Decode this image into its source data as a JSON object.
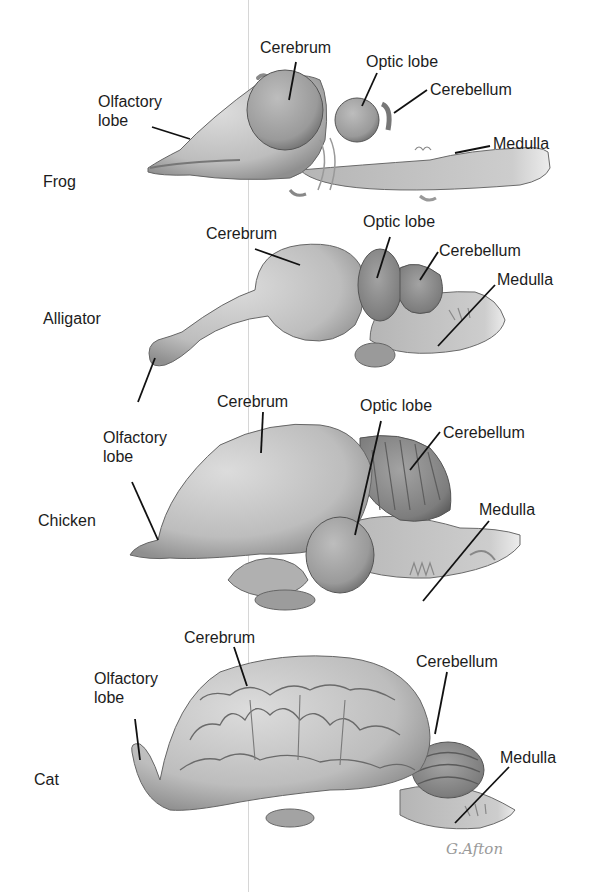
{
  "diagram": {
    "type": "comparative anatomy illustration",
    "colors": {
      "tissue_light": "#cfcfcf",
      "tissue_mid": "#a9a9a9",
      "tissue_dark": "#7a7a7a",
      "outline": "#5a5a5a",
      "leader": "#111111",
      "text": "#1c1c1c"
    },
    "signature": "G.Afton",
    "brains": [
      {
        "species": "Frog",
        "labels": {
          "olfactory": "Olfactory lobe",
          "olfactory_l1": "Olfactory",
          "olfactory_l2": "lobe",
          "cerebrum": "Cerebrum",
          "optic": "Optic lobe",
          "cerebellum": "Cerebellum",
          "medulla": "Medulla"
        }
      },
      {
        "species": "Alligator",
        "labels": {
          "cerebrum": "Cerebrum",
          "optic": "Optic lobe",
          "cerebellum": "Cerebellum",
          "medulla": "Medulla"
        }
      },
      {
        "species": "Chicken",
        "labels": {
          "olfactory": "Olfactory lobe",
          "olfactory_l1": "Olfactory",
          "olfactory_l2": "lobe",
          "cerebrum": "Cerebrum",
          "optic": "Optic lobe",
          "cerebellum": "Cerebellum",
          "medulla": "Medulla"
        }
      },
      {
        "species": "Cat",
        "labels": {
          "olfactory": "Olfactory lobe",
          "olfactory_l1": "Olfactory",
          "olfactory_l2": "lobe",
          "cerebrum": "Cerebrum",
          "cerebellum": "Cerebellum",
          "medulla": "Medulla"
        }
      }
    ]
  }
}
